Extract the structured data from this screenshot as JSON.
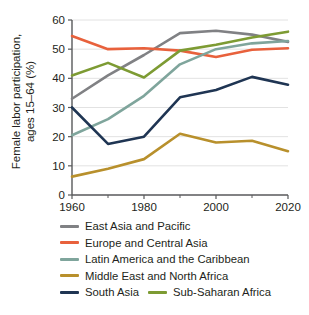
{
  "chart_data": {
    "type": "line",
    "title": "",
    "xlabel": "",
    "ylabel": "Female labor participation,\nages 15–64 (%)",
    "x": [
      1960,
      1970,
      1980,
      1990,
      2000,
      2010,
      2020
    ],
    "xlim": [
      1960,
      2020
    ],
    "ylim": [
      0,
      60
    ],
    "xticks": [
      1960,
      1980,
      2000,
      2020
    ],
    "xticklabels": [
      "1960",
      "1980",
      "2000",
      "2020"
    ],
    "xminorticks": [
      1970,
      1990,
      2010
    ],
    "yticks": [
      0,
      10,
      20,
      30,
      40,
      50,
      60
    ],
    "yticklabels": [
      "0",
      "10",
      "20",
      "30",
      "40",
      "50",
      "60"
    ],
    "grid": "horizontal",
    "legend_position": "below",
    "series": [
      {
        "name": "East Asia and Pacific",
        "color": "#808184",
        "values": [
          33.0,
          41.0,
          48.0,
          55.5,
          56.3,
          55.0,
          52.5
        ]
      },
      {
        "name": "Europe and Central Asia",
        "color": "#E8613C",
        "values": [
          54.5,
          50.0,
          50.3,
          49.5,
          47.3,
          49.8,
          50.3
        ]
      },
      {
        "name": "Latin America and the Caribbean",
        "color": "#7FA59C",
        "values": [
          20.5,
          26.0,
          34.0,
          44.8,
          50.0,
          52.0,
          52.8
        ]
      },
      {
        "name": "Middle East and North Africa",
        "color": "#B8902C",
        "values": [
          6.3,
          9.0,
          12.3,
          21.0,
          18.0,
          18.6,
          15.0
        ]
      },
      {
        "name": "South Asia",
        "color": "#1F3553",
        "values": [
          30.0,
          17.5,
          20.0,
          33.5,
          36.0,
          40.5,
          37.8
        ]
      },
      {
        "name": "Sub-Saharan Africa",
        "color": "#7D9B33",
        "values": [
          41.0,
          45.3,
          40.3,
          49.5,
          51.5,
          54.0,
          56.0
        ]
      }
    ]
  },
  "legend": {
    "rows": [
      [
        {
          "label": "East Asia and Pacific",
          "color": "#808184"
        }
      ],
      [
        {
          "label": "Europe and Central Asia",
          "color": "#E8613C"
        }
      ],
      [
        {
          "label": "Latin America and the Caribbean",
          "color": "#7FA59C"
        }
      ],
      [
        {
          "label": "Middle East and North Africa",
          "color": "#B8902C"
        }
      ],
      [
        {
          "label": "South Asia",
          "color": "#1F3553"
        },
        {
          "label": "Sub-Saharan Africa",
          "color": "#7D9B33"
        }
      ]
    ]
  },
  "axes": {
    "ylabel_line1": "Female labor participation,",
    "ylabel_line2": "ages 15–64 (%)"
  }
}
